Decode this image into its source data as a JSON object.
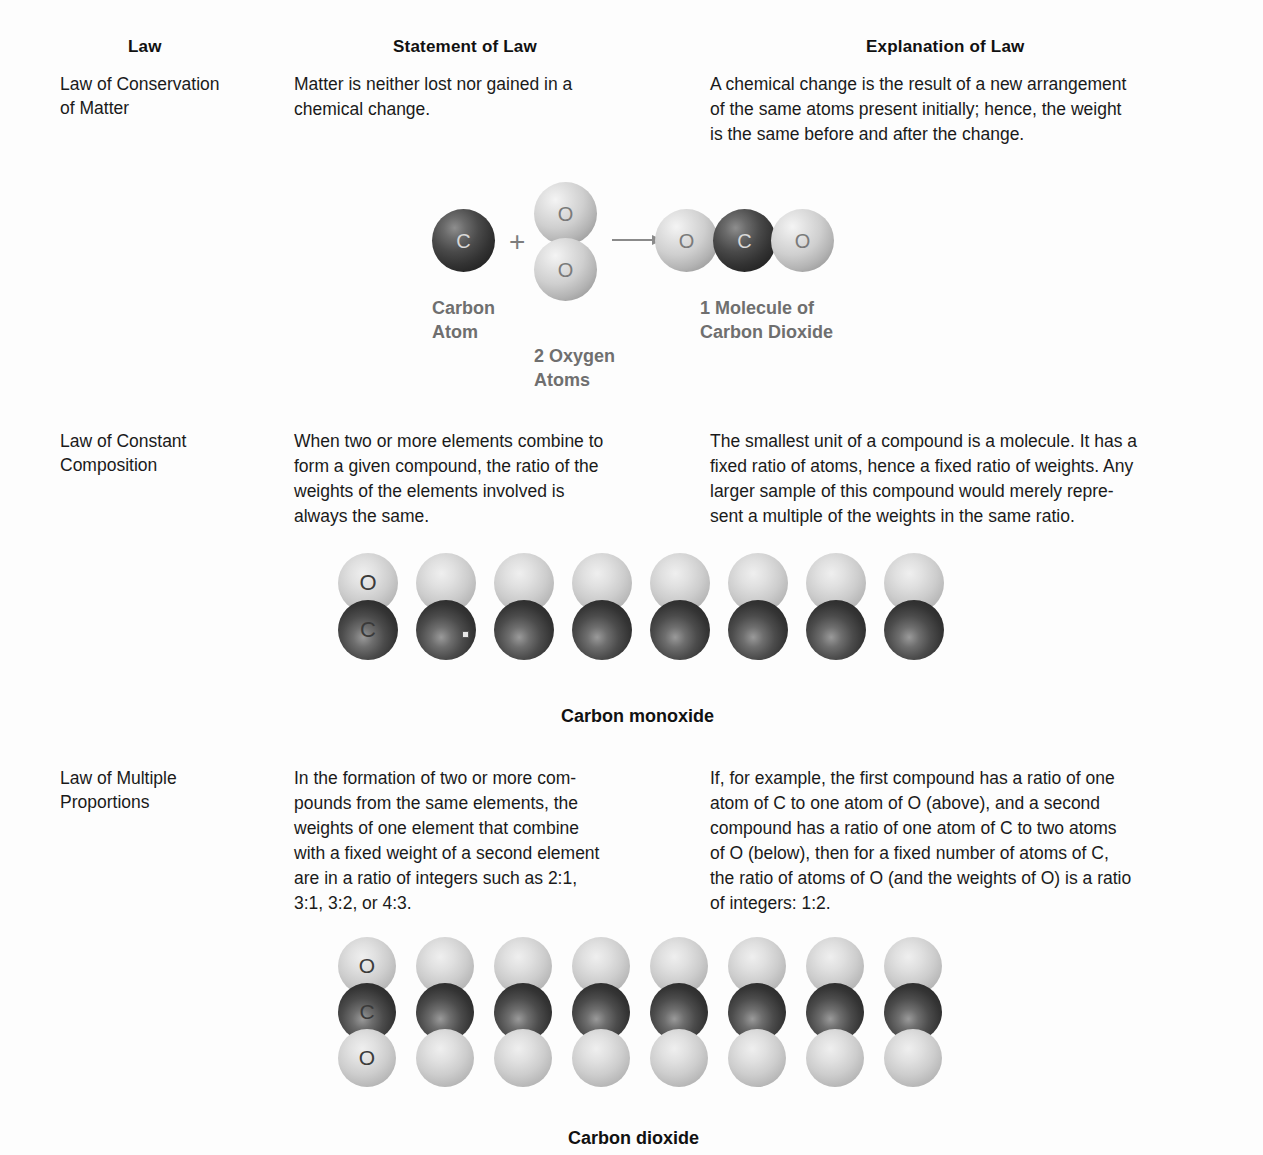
{
  "headers": {
    "law": "Law",
    "statement": "Statement of Law",
    "explanation": "Explanation of Law"
  },
  "rows": [
    {
      "name_line1": "Law of Conservation",
      "name_line2": "of Matter",
      "statement": "Matter is neither lost nor gained in a chemical change.",
      "explanation": "A chemical change is the result of a new arrangement of the same atoms present initially; hence, the weight is the same before and after the change."
    },
    {
      "name_line1": "Law of Constant",
      "name_line2": "Composition",
      "statement": "When two or more elements combine to form a given compound, the ratio of the weights of the elements involved is always the same.",
      "explanation": "The smallest unit of a compound is a molecule. It has a fixed ratio of atoms, hence a fixed ratio of weights. Any larger sample of this compound would merely repre-sent a multiple of the weights in the same ratio."
    },
    {
      "name_line1": "Law of Multiple",
      "name_line2": "Proportions",
      "statement": "In the formation of two or more com-pounds from the same elements, the weights of one element that combine with a fixed weight of a second element are in a ratio of integers such as 2:1, 3:1, 3:2, or 4:3.",
      "explanation": "If, for example, the first compound has a ratio of one atom of C to one atom of O (above), and a second compound has a ratio of one atom of C to two atoms of O (below), then for a fixed number of atoms of C, the ratio of atoms of O (and the weights of O) is a ratio of integers: 1:2."
    }
  ],
  "statement_lines": {
    "row1": [
      "Matter is neither lost nor gained in a",
      "chemical change."
    ],
    "row2": [
      "When two or more elements combine to",
      "form a given compound, the ratio of the",
      "weights of the elements involved is",
      "always the same."
    ],
    "row3": [
      "In the formation of two or more com-",
      "pounds from the same elements, the",
      "weights of one element that combine",
      "with a fixed weight of a second element",
      "are in a ratio of integers such as 2:1,",
      "3:1, 3:2, or 4:3."
    ]
  },
  "explanation_lines": {
    "row1": [
      "A chemical change is the result of a new arrangement",
      "of the same atoms present initially; hence, the weight",
      "is the same before and after the change."
    ],
    "row2": [
      "The smallest unit of a compound is a molecule. It has a",
      "fixed ratio of atoms, hence a fixed ratio of weights. Any",
      "larger sample of this compound would merely repre-",
      "sent a multiple of the weights in the same ratio."
    ],
    "row3": [
      "If, for example, the first compound has a ratio of one",
      "atom of C to one atom of O (above), and a second",
      "compound has a ratio of one atom of C to two atoms",
      "of O (below), then for a fixed number of atoms of C,",
      "the ratio of atoms of O (and the weights of O) is a ratio",
      "of integers: 1:2."
    ]
  },
  "reaction_diagram": {
    "plus_sign": "+",
    "reactant_carbon_symbol": "C",
    "reactant_oxygen_top_symbol": "O",
    "reactant_oxygen_bottom_symbol": "O",
    "product_oxygen_left_symbol": "O",
    "product_carbon_symbol": "C",
    "product_oxygen_right_symbol": "O",
    "label_carbon_line1": "Carbon",
    "label_carbon_line2": "Atom",
    "label_oxygen_line1": "2 Oxygen",
    "label_oxygen_line2": "Atoms",
    "label_product_line1": "1 Molecule of",
    "label_product_line2": "Carbon Dioxide"
  },
  "co_row": {
    "caption": "Carbon monoxide",
    "molecule_count": 8,
    "labeled_index": 0,
    "top_symbol": "O",
    "bottom_symbol": "C"
  },
  "co2_row": {
    "caption": "Carbon dioxide",
    "molecule_count": 8,
    "labeled_index": 0,
    "top_symbol": "O",
    "middle_symbol": "C",
    "bottom_symbol": "O"
  },
  "colors": {
    "background": "#fdfdfd",
    "text": "#1a1a1a",
    "diagram_label": "#6f6f6f",
    "oxygen_light": "#cfcfcf",
    "carbon_dark": "#333333",
    "arrow": "#8a8a8a"
  }
}
